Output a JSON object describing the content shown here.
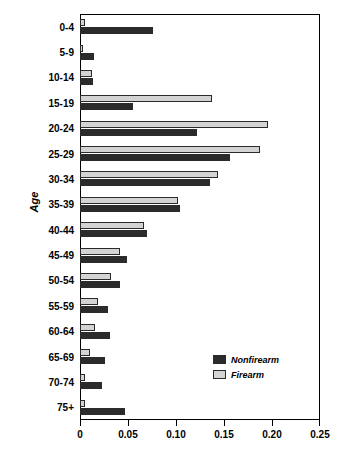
{
  "chart_data": {
    "type": "bar",
    "orientation": "horizontal",
    "title": "",
    "xlabel": "",
    "ylabel": "Age",
    "xlim": [
      0,
      0.25
    ],
    "xticks": [
      "0",
      "0.05",
      "0.10",
      "0.15",
      "0.20",
      "0.25"
    ],
    "xtick_values": [
      0,
      0.05,
      0.1,
      0.15,
      0.2,
      0.25
    ],
    "grid": false,
    "legend_position": "inner-lower-right",
    "categories": [
      "0-4",
      "5-9",
      "10-14",
      "15-19",
      "20-24",
      "25-29",
      "30-34",
      "35-39",
      "40-44",
      "45-49",
      "50-54",
      "55-59",
      "60-64",
      "65-69",
      "70-74",
      "75+"
    ],
    "series": [
      {
        "name": "Nonfirearm",
        "color": "#2b2b2b",
        "values": [
          0.076,
          0.015,
          0.014,
          0.055,
          0.122,
          0.156,
          0.135,
          0.104,
          0.07,
          0.049,
          0.042,
          0.029,
          0.031,
          0.026,
          0.023,
          0.047
        ]
      },
      {
        "name": "Firearm",
        "color": "#d3d3d3",
        "values": [
          0.005,
          0.003,
          0.013,
          0.138,
          0.196,
          0.188,
          0.144,
          0.102,
          0.067,
          0.042,
          0.032,
          0.019,
          0.016,
          0.01,
          0.005,
          0.005
        ]
      }
    ]
  },
  "legend": {
    "items": [
      {
        "label": "Nonfirearm",
        "key": "nonfirearm"
      },
      {
        "label": "Firearm",
        "key": "firearm"
      }
    ]
  }
}
